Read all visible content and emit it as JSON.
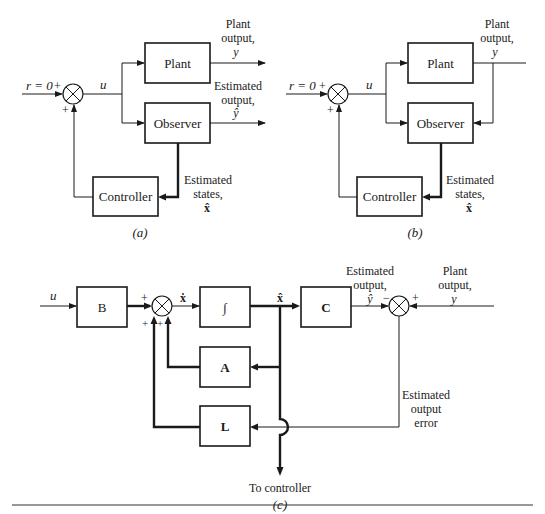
{
  "panel_a": {
    "caption": "(a)",
    "input_label": "r = 0",
    "sum_plus_left": "+",
    "sum_plus_bottom": "+",
    "u_label": "u",
    "plant": "Plant",
    "observer": "Observer",
    "controller": "Controller",
    "plant_output": [
      "Plant",
      "output,",
      "y"
    ],
    "estimated_output": [
      "Estimated",
      "output,",
      "ŷ"
    ],
    "estimated_states": [
      "Estimated",
      "states,",
      "x̂"
    ]
  },
  "panel_b": {
    "caption": "(b)",
    "input_label": "r = 0",
    "sum_plus_left": "+",
    "sum_plus_bottom": "+",
    "u_label": "u",
    "plant": "Plant",
    "observer": "Observer",
    "controller": "Controller",
    "plant_output": [
      "Plant",
      "output,",
      "y"
    ],
    "estimated_states": [
      "Estimated",
      "states,",
      "x̂"
    ]
  },
  "panel_c": {
    "caption": "(c)",
    "u_label": "u",
    "b_block": "B",
    "integrator": "∫",
    "a_block": "A",
    "l_block": "L",
    "c_block": "C",
    "xdot_label": "ẋ",
    "xhat_label": "x̂",
    "sum1_signs": [
      "+",
      "+",
      "+"
    ],
    "sum2_minus": "−",
    "sum2_plus": "+",
    "yhat_label": "ŷ",
    "estimated_output": [
      "Estimated",
      "output,"
    ],
    "plant_output": [
      "Plant",
      "output,",
      "y"
    ],
    "output_error": [
      "Estimated",
      "output",
      "error"
    ],
    "to_controller": "To controller"
  }
}
